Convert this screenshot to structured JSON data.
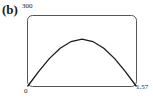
{
  "panel": {
    "label": "(b)"
  },
  "axes": {
    "y_top_tick": "300",
    "x_left_tick": "0",
    "x_right_tick": "1.57"
  },
  "colors": {
    "curve": "#1a1a1a",
    "frame": "#555555"
  },
  "chart_data": {
    "type": "line",
    "title": "(b)",
    "xlabel": "",
    "ylabel": "",
    "xlim": [
      0,
      1.57
    ],
    "ylim": [
      0,
      300
    ],
    "x_ticks": [
      "0",
      "1.57"
    ],
    "y_ticks": [
      "300"
    ],
    "grid": false,
    "legend": null,
    "series": [
      {
        "name": "curve",
        "x": [
          0,
          0.157,
          0.314,
          0.471,
          0.628,
          0.785,
          0.942,
          1.099,
          1.256,
          1.413,
          1.57
        ],
        "values": [
          0,
          62,
          118,
          162,
          190,
          200,
          190,
          162,
          118,
          62,
          0
        ]
      }
    ]
  }
}
